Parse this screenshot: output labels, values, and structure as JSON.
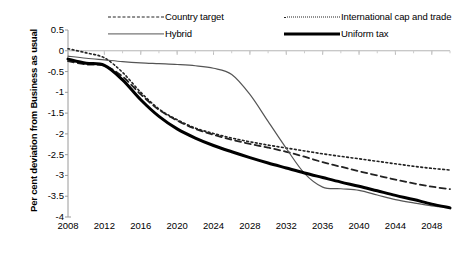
{
  "chart_data": {
    "type": "line",
    "title": "",
    "xlabel": "",
    "ylabel": "Per cent deviation from Business as usual",
    "xlim": [
      2008,
      2050
    ],
    "ylim": [
      -4,
      0.5
    ],
    "grid": false,
    "legend_position": "top",
    "xticks": [
      2008,
      2012,
      2016,
      2020,
      2024,
      2028,
      2032,
      2036,
      2040,
      2044,
      2048
    ],
    "yticks": [
      "0.5",
      "0",
      "-0.5",
      "-1",
      "-1.5",
      "-2",
      "-2.5",
      "-3",
      "-3.5",
      "-4"
    ],
    "x": [
      2008,
      2010,
      2012,
      2014,
      2016,
      2018,
      2020,
      2022,
      2024,
      2026,
      2028,
      2030,
      2032,
      2034,
      2036,
      2038,
      2040,
      2042,
      2044,
      2046,
      2048,
      2050
    ],
    "series": [
      {
        "name": "Country target",
        "style": "dashed",
        "color": "#222222",
        "width": 1.8,
        "values": [
          -0.25,
          -0.33,
          -0.36,
          -0.62,
          -1.05,
          -1.42,
          -1.68,
          -1.88,
          -2.02,
          -2.14,
          -2.24,
          -2.33,
          -2.43,
          -2.55,
          -2.68,
          -2.79,
          -2.9,
          -3.0,
          -3.1,
          -3.19,
          -3.27,
          -3.33
        ]
      },
      {
        "name": "International cap and trade",
        "style": "dotted",
        "color": "#222222",
        "width": 1.6,
        "values": [
          0.05,
          -0.05,
          -0.17,
          -0.52,
          -1.0,
          -1.4,
          -1.66,
          -1.86,
          -1.99,
          -2.1,
          -2.19,
          -2.27,
          -2.34,
          -2.41,
          -2.48,
          -2.54,
          -2.6,
          -2.66,
          -2.72,
          -2.78,
          -2.83,
          -2.87
        ]
      },
      {
        "name": "Hybrid",
        "style": "solid",
        "color": "#555555",
        "width": 1.2,
        "values": [
          -0.13,
          -0.18,
          -0.22,
          -0.26,
          -0.29,
          -0.31,
          -0.33,
          -0.36,
          -0.42,
          -0.57,
          -1.05,
          -1.7,
          -2.35,
          -2.95,
          -3.28,
          -3.32,
          -3.36,
          -3.47,
          -3.58,
          -3.66,
          -3.73,
          -3.77
        ]
      },
      {
        "name": "Uniform tax",
        "style": "solid",
        "color": "#000000",
        "width": 3.0,
        "values": [
          -0.2,
          -0.3,
          -0.35,
          -0.7,
          -1.18,
          -1.58,
          -1.88,
          -2.1,
          -2.28,
          -2.43,
          -2.57,
          -2.7,
          -2.82,
          -2.94,
          -3.05,
          -3.16,
          -3.26,
          -3.37,
          -3.48,
          -3.58,
          -3.69,
          -3.78
        ]
      }
    ]
  }
}
